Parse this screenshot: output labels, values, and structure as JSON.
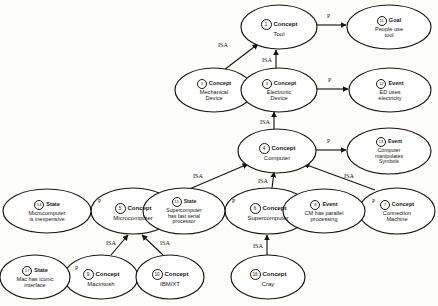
{
  "diagram": {
    "background_color": "#fdfdfb",
    "ink_color": "#17150f",
    "nodes": [
      {
        "id": "tool",
        "marker": "1",
        "type": "Concept",
        "lines": [
          "Tool"
        ],
        "cx": 279,
        "cy": 27,
        "rx": 38,
        "ry": 22
      },
      {
        "id": "goal",
        "marker": "11",
        "type": "Goal",
        "lines": [
          "People use",
          "tool"
        ],
        "cx": 389,
        "cy": 27,
        "rx": 42,
        "ry": 22
      },
      {
        "id": "mechanical",
        "marker": "2",
        "type": "Concept",
        "lines": [
          "Mechanical",
          "Device"
        ],
        "cx": 214,
        "cy": 90,
        "rx": 39,
        "ry": 22
      },
      {
        "id": "electronic",
        "marker": "3",
        "type": "Concept",
        "lines": [
          "Electronic",
          "Device"
        ],
        "cx": 279,
        "cy": 90,
        "rx": 38,
        "ry": 22
      },
      {
        "id": "edelec",
        "marker": "12",
        "type": "Event",
        "lines": [
          "ED uses",
          "electricity"
        ],
        "cx": 390,
        "cy": 90,
        "rx": 41,
        "ry": 22
      },
      {
        "id": "computer",
        "marker": "4",
        "type": "Concept",
        "lines": [
          "Computer"
        ],
        "cx": 277,
        "cy": 151,
        "rx": 39,
        "ry": 22
      },
      {
        "id": "symbols",
        "marker": "13",
        "type": "Event",
        "lines": [
          "Computer",
          "manipulates",
          "Symbols"
        ],
        "cx": 389,
        "cy": 151,
        "rx": 42,
        "ry": 23
      },
      {
        "id": "microcomputer",
        "marker": "5",
        "type": "Concept",
        "lines": [
          "Microcomputer"
        ],
        "cx": 133,
        "cy": 211,
        "rx": 42,
        "ry": 23
      },
      {
        "id": "inexpensive",
        "marker": "14",
        "type": "State",
        "lines": [
          "Microcomputer",
          "is inexpensive"
        ],
        "cx": 47,
        "cy": 211,
        "rx": 44,
        "ry": 22
      },
      {
        "id": "supercomputer",
        "marker": "6",
        "type": "Concept",
        "lines": [
          "Supercomputer"
        ],
        "cx": 268,
        "cy": 211,
        "rx": 43,
        "ry": 23
      },
      {
        "id": "serialproc",
        "marker": "15",
        "type": "State",
        "lines": [
          "Supercomputer",
          "has fast serial",
          "processor"
        ],
        "cx": 184,
        "cy": 211,
        "rx": 41,
        "ry": 23
      },
      {
        "id": "connection",
        "marker": "7",
        "type": "Concept",
        "lines": [
          "Connection",
          "Machine"
        ],
        "cx": 397,
        "cy": 211,
        "rx": 38,
        "ry": 23
      },
      {
        "id": "cmparallel",
        "marker": "8",
        "type": "Event",
        "lines": [
          "CM has parallel",
          "processing"
        ],
        "cx": 324,
        "cy": 211,
        "rx": 41,
        "ry": 22
      },
      {
        "id": "macintosh",
        "marker": "9",
        "type": "Concept",
        "lines": [
          "Macintosh"
        ],
        "cx": 101,
        "cy": 277,
        "rx": 37,
        "ry": 22
      },
      {
        "id": "iconic",
        "marker": "17",
        "type": "State",
        "lines": [
          "Mac has iconic",
          "interface"
        ],
        "cx": 35,
        "cy": 277,
        "rx": 35,
        "ry": 22
      },
      {
        "id": "ibmxt",
        "marker": "10",
        "type": "Concept",
        "lines": [
          "IBM/XT"
        ],
        "cx": 170,
        "cy": 277,
        "rx": 34,
        "ry": 22
      },
      {
        "id": "cray",
        "marker": "16",
        "type": "Concept",
        "lines": [
          "Cray"
        ],
        "cx": 268,
        "cy": 277,
        "rx": 37,
        "ry": 22
      }
    ],
    "edges": [
      {
        "from": "tool",
        "to": "goal",
        "label": "P",
        "x1": 317,
        "y1": 25,
        "x2": 346,
        "y2": 25,
        "lx": 327,
        "ly": 13
      },
      {
        "from": "mechanical",
        "to": "tool",
        "label": "ISA",
        "x1": 224,
        "y1": 70,
        "x2": 258,
        "y2": 44,
        "lx": 218,
        "ly": 41
      },
      {
        "from": "electronic",
        "to": "tool",
        "label": "ISA",
        "x1": 276,
        "y1": 68,
        "x2": 276,
        "y2": 50,
        "lx": 262,
        "ly": 56
      },
      {
        "from": "electronic",
        "to": "edelec",
        "label": "P",
        "x1": 317,
        "y1": 89,
        "x2": 348,
        "y2": 89,
        "lx": 328,
        "ly": 77
      },
      {
        "from": "computer",
        "to": "electronic",
        "label": "ISA",
        "x1": 274,
        "y1": 129,
        "x2": 274,
        "y2": 112,
        "lx": 260,
        "ly": 118
      },
      {
        "from": "computer",
        "to": "symbols",
        "label": "P",
        "x1": 316,
        "y1": 150,
        "x2": 346,
        "y2": 150,
        "lx": 327,
        "ly": 138
      },
      {
        "from": "microcomputer",
        "to": "computer",
        "label": "ISA",
        "x1": 166,
        "y1": 199,
        "x2": 248,
        "y2": 164,
        "lx": 193,
        "ly": 172
      },
      {
        "from": "microcomputer",
        "to": "inexpensive",
        "label": "P",
        "x1": 91,
        "y1": 209,
        "x2": 93,
        "y2": 209,
        "lx": 98,
        "ly": 198
      },
      {
        "from": "supercomputer",
        "to": "computer",
        "label": "ISA",
        "x1": 272,
        "y1": 188,
        "x2": 274,
        "y2": 172,
        "lx": 258,
        "ly": 177
      },
      {
        "from": "supercomputer",
        "to": "serialproc",
        "label": "P",
        "x1": 225,
        "y1": 209,
        "x2": 227,
        "y2": 209,
        "lx": 232,
        "ly": 198
      },
      {
        "from": "connection",
        "to": "computer",
        "label": "ISA",
        "x1": 375,
        "y1": 190,
        "x2": 304,
        "y2": 164,
        "lx": 344,
        "ly": 172
      },
      {
        "from": "connection",
        "to": "cmparallel",
        "label": "P",
        "x1": 359,
        "y1": 209,
        "x2": 366,
        "y2": 209,
        "lx": 372,
        "ly": 198
      },
      {
        "from": "macintosh",
        "to": "microcomputer",
        "label": "ISA",
        "x1": 111,
        "y1": 255,
        "x2": 128,
        "y2": 235,
        "lx": 106,
        "ly": 239
      },
      {
        "from": "ibmxt",
        "to": "microcomputer",
        "label": "ISA",
        "x1": 163,
        "y1": 255,
        "x2": 142,
        "y2": 235,
        "lx": 160,
        "ly": 239
      },
      {
        "from": "macintosh",
        "to": "iconic",
        "label": "P",
        "x1": 64,
        "y1": 276,
        "x2": 70,
        "y2": 276,
        "lx": 75,
        "ly": 265
      },
      {
        "from": "cray",
        "to": "supercomputer",
        "label": "ISA",
        "x1": 267,
        "y1": 255,
        "x2": 267,
        "y2": 235,
        "lx": 253,
        "ly": 242
      }
    ]
  }
}
